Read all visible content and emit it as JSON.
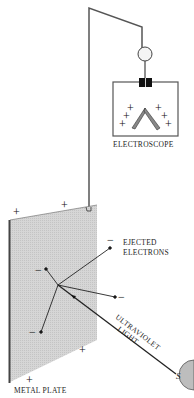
{
  "diagram": {
    "labels": {
      "electroscope": "ELECTROSCOPE",
      "ejected_line1": "EJECTED",
      "ejected_line2": "ELECTRONS",
      "uv_line1": "ULTRAVIOLET",
      "uv_line2": "LIGHT",
      "metal_plate": "METAL PLATE",
      "source": "S"
    },
    "signs": {
      "plus": "+",
      "minus": "−"
    },
    "colors": {
      "plate_fill": "#d4d4d4",
      "plate_edge": "#555555",
      "line": "#333333",
      "source_fill": "#bfbfbf"
    }
  }
}
